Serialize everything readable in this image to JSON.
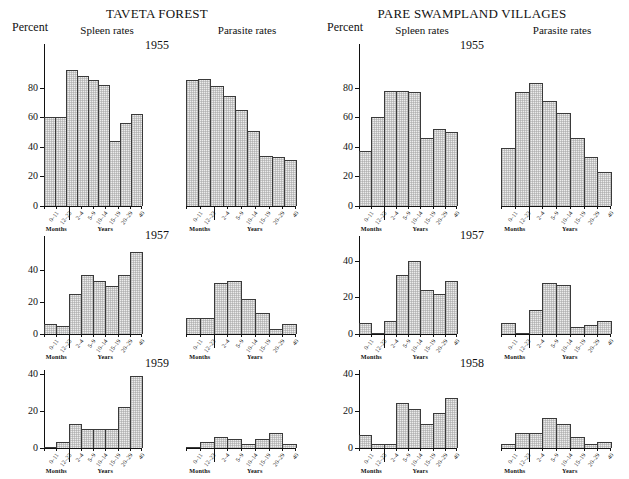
{
  "page_bleed_text": "",
  "columns": [
    {
      "title": "TAVETA FOREST",
      "percent_label": "Percent",
      "sub_spleen": "Spleen rates",
      "sub_parasite": "Parasite rates"
    },
    {
      "title": "PARE SWAMPLAND VILLAGES",
      "percent_label": "Percent",
      "sub_spleen": "Spleen rates",
      "sub_parasite": "Parasite rates"
    }
  ],
  "axis": {
    "categories": [
      "0–11",
      "12–23",
      "2–4",
      "5–9",
      "10–14",
      "15–19",
      "20–29",
      "40"
    ],
    "group_months": "Months",
    "group_years": "Years"
  },
  "row_years": {
    "left": [
      "1955",
      "1957",
      "1959"
    ],
    "right": [
      "1955",
      "1957",
      "1958"
    ]
  },
  "chart_data": {
    "type": "bar",
    "xlabel": "Age (Months / Years)",
    "ylabel": "Percent",
    "grid": false,
    "legend": "none",
    "categories": [
      "0–11",
      "12–23",
      "2–4",
      "5–9",
      "10–14",
      "15–19",
      "20–29",
      "40"
    ],
    "panels": [
      {
        "area": "TAVETA FOREST",
        "measure": "Spleen rates",
        "year": "1955",
        "ylim": [
          0,
          100
        ],
        "yticks": [
          0,
          20,
          40,
          60,
          80
        ],
        "values": [
          60,
          60,
          92,
          88,
          85,
          82,
          44,
          56,
          62
        ]
      },
      {
        "area": "TAVETA FOREST",
        "measure": "Parasite rates",
        "year": "1955",
        "ylim": [
          0,
          100
        ],
        "yticks": [
          0,
          20,
          40,
          60,
          80
        ],
        "values": [
          85,
          86,
          81,
          74,
          65,
          51,
          34,
          33,
          31
        ]
      },
      {
        "area": "TAVETA FOREST",
        "measure": "Spleen rates",
        "year": "1957",
        "ylim": [
          0,
          55
        ],
        "yticks": [
          0,
          20,
          40
        ],
        "values": [
          6,
          5,
          25,
          37,
          33,
          30,
          37,
          51
        ]
      },
      {
        "area": "TAVETA FOREST",
        "measure": "Parasite rates",
        "year": "1957",
        "ylim": [
          0,
          55
        ],
        "yticks": [
          0,
          20,
          40
        ],
        "values": [
          10,
          10,
          32,
          33,
          22,
          13,
          3,
          6
        ]
      },
      {
        "area": "TAVETA FOREST",
        "measure": "Spleen rates",
        "year": "1959",
        "ylim": [
          0,
          42
        ],
        "yticks": [
          0,
          20,
          40
        ],
        "values": [
          0,
          3,
          13,
          10,
          10,
          10,
          22,
          39
        ]
      },
      {
        "area": "TAVETA FOREST",
        "measure": "Parasite rates",
        "year": "1959",
        "ylim": [
          0,
          42
        ],
        "yticks": [
          0,
          20,
          40
        ],
        "values": [
          0,
          3,
          6,
          5,
          2,
          5,
          8,
          2
        ]
      },
      {
        "area": "PARE SWAMPLAND VILLAGES",
        "measure": "Spleen rates",
        "year": "1955",
        "ylim": [
          0,
          100
        ],
        "yticks": [
          0,
          20,
          40,
          60,
          80
        ],
        "values": [
          37,
          60,
          78,
          78,
          77,
          46,
          52,
          50
        ]
      },
      {
        "area": "PARE SWAMPLAND VILLAGES",
        "measure": "Parasite rates",
        "year": "1955",
        "ylim": [
          0,
          100
        ],
        "yticks": [
          0,
          20,
          40,
          60,
          80
        ],
        "values": [
          39,
          77,
          83,
          71,
          63,
          46,
          33,
          23
        ]
      },
      {
        "area": "PARE SWAMPLAND VILLAGES",
        "measure": "Spleen rates",
        "year": "1957",
        "ylim": [
          0,
          48
        ],
        "yticks": [
          0,
          20,
          40
        ],
        "values": [
          6,
          0,
          7,
          32,
          40,
          24,
          22,
          29
        ]
      },
      {
        "area": "PARE SWAMPLAND VILLAGES",
        "measure": "Parasite rates",
        "year": "1957",
        "ylim": [
          0,
          48
        ],
        "yticks": [
          0,
          20,
          40
        ],
        "values": [
          6,
          0,
          13,
          28,
          27,
          4,
          5,
          7
        ]
      },
      {
        "area": "PARE SWAMPLAND VILLAGES",
        "measure": "Spleen rates",
        "year": "1958",
        "ylim": [
          0,
          42
        ],
        "yticks": [
          0,
          20,
          40
        ],
        "values": [
          7,
          2,
          2,
          24,
          21,
          13,
          19,
          27
        ]
      },
      {
        "area": "PARE SWAMPLAND VILLAGES",
        "measure": "Parasite rates",
        "year": "1958",
        "ylim": [
          0,
          42
        ],
        "yticks": [
          0,
          20,
          40
        ],
        "values": [
          2,
          8,
          8,
          16,
          13,
          6,
          2,
          3
        ]
      }
    ]
  }
}
